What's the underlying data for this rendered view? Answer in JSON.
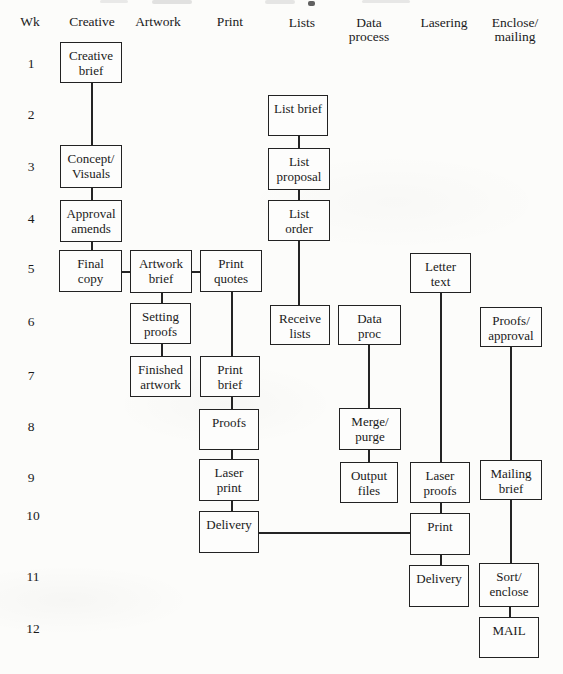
{
  "figure": {
    "type": "flowchart-schedule",
    "ink_color": "#222222",
    "paper_color": "#fcfcfa",
    "columns": [
      {
        "id": "wk",
        "lines": [
          "Wk"
        ],
        "x": 30,
        "y": 15
      },
      {
        "id": "creative",
        "lines": [
          "Creative"
        ],
        "x": 92,
        "y": 15
      },
      {
        "id": "artwork",
        "lines": [
          "Artwork"
        ],
        "x": 158,
        "y": 15
      },
      {
        "id": "print",
        "lines": [
          "Print"
        ],
        "x": 230,
        "y": 15
      },
      {
        "id": "lists",
        "lines": [
          "Lists"
        ],
        "x": 302,
        "y": 16
      },
      {
        "id": "data-process",
        "lines": [
          "Data",
          "process"
        ],
        "x": 369,
        "y": 16
      },
      {
        "id": "lasering",
        "lines": [
          "Lasering"
        ],
        "x": 444,
        "y": 16
      },
      {
        "id": "enclose-mailing",
        "lines": [
          "Enclose/",
          "mailing"
        ],
        "x": 515,
        "y": 16
      }
    ],
    "weeks": [
      {
        "label": "1",
        "x": 31,
        "y": 64
      },
      {
        "label": "2",
        "x": 31,
        "y": 115
      },
      {
        "label": "3",
        "x": 31,
        "y": 167
      },
      {
        "label": "4",
        "x": 31,
        "y": 219
      },
      {
        "label": "5",
        "x": 31,
        "y": 269
      },
      {
        "label": "6",
        "x": 31,
        "y": 322
      },
      {
        "label": "7",
        "x": 31,
        "y": 376
      },
      {
        "label": "8",
        "x": 31,
        "y": 427
      },
      {
        "label": "9",
        "x": 31,
        "y": 478
      },
      {
        "label": "10",
        "x": 33,
        "y": 516
      },
      {
        "label": "11",
        "x": 33,
        "y": 577
      },
      {
        "label": "12",
        "x": 33,
        "y": 629
      }
    ],
    "boxes": [
      {
        "id": "creative-brief",
        "column": "creative",
        "week": 1,
        "lines": [
          "Creative",
          "brief"
        ],
        "x": 60,
        "y": 42,
        "w": 62,
        "h": 41
      },
      {
        "id": "concept-visuals",
        "column": "creative",
        "week": 3,
        "lines": [
          "Concept/",
          "Visuals"
        ],
        "x": 60,
        "y": 145,
        "w": 62,
        "h": 43
      },
      {
        "id": "approval-amends",
        "column": "creative",
        "week": 4,
        "lines": [
          "Approval",
          "amends"
        ],
        "x": 60,
        "y": 200,
        "w": 62,
        "h": 42
      },
      {
        "id": "final-copy",
        "column": "creative",
        "week": 5,
        "lines": [
          "Final",
          "copy"
        ],
        "x": 59,
        "y": 250,
        "w": 63,
        "h": 42
      },
      {
        "id": "artwork-brief",
        "column": "artwork",
        "week": 5,
        "lines": [
          "Artwork",
          "brief"
        ],
        "x": 130,
        "y": 250,
        "w": 62,
        "h": 43
      },
      {
        "id": "setting-proofs",
        "column": "artwork",
        "week": 6,
        "lines": [
          "Setting",
          "proofs"
        ],
        "x": 130,
        "y": 303,
        "w": 61,
        "h": 41
      },
      {
        "id": "finished-artwork",
        "column": "artwork",
        "week": 7,
        "lines": [
          "Finished",
          "artwork"
        ],
        "x": 130,
        "y": 356,
        "w": 61,
        "h": 41
      },
      {
        "id": "print-quotes",
        "column": "print",
        "week": 5,
        "lines": [
          "Print",
          "quotes"
        ],
        "x": 200,
        "y": 250,
        "w": 62,
        "h": 42
      },
      {
        "id": "print-brief",
        "column": "print",
        "week": 7,
        "lines": [
          "Print",
          "brief"
        ],
        "x": 200,
        "y": 356,
        "w": 60,
        "h": 41
      },
      {
        "id": "proofs",
        "column": "print",
        "week": 8,
        "lines": [
          "Proofs"
        ],
        "x": 199,
        "y": 409,
        "w": 60,
        "h": 41
      },
      {
        "id": "laser-print",
        "column": "print",
        "week": 9,
        "lines": [
          "Laser",
          "print"
        ],
        "x": 199,
        "y": 459,
        "w": 60,
        "h": 42
      },
      {
        "id": "delivery-print",
        "column": "print",
        "week": 10,
        "lines": [
          "Delivery"
        ],
        "x": 199,
        "y": 511,
        "w": 60,
        "h": 42
      },
      {
        "id": "list-brief",
        "column": "lists",
        "week": 2,
        "lines": [
          "List brief"
        ],
        "x": 268,
        "y": 95,
        "w": 60,
        "h": 41
      },
      {
        "id": "list-proposal",
        "column": "lists",
        "week": 3,
        "lines": [
          "List",
          "proposal"
        ],
        "x": 268,
        "y": 148,
        "w": 62,
        "h": 42
      },
      {
        "id": "list-order",
        "column": "lists",
        "week": 4,
        "lines": [
          "List",
          "order"
        ],
        "x": 268,
        "y": 200,
        "w": 62,
        "h": 41
      },
      {
        "id": "receive-lists",
        "column": "lists",
        "week": 6,
        "lines": [
          "Receive",
          "lists"
        ],
        "x": 270,
        "y": 305,
        "w": 60,
        "h": 40
      },
      {
        "id": "data-proc",
        "column": "data-process",
        "week": 6,
        "lines": [
          "Data",
          "proc"
        ],
        "x": 338,
        "y": 305,
        "w": 63,
        "h": 40
      },
      {
        "id": "merge-purge",
        "column": "data-process",
        "week": 8,
        "lines": [
          "Merge/",
          "purge"
        ],
        "x": 339,
        "y": 408,
        "w": 62,
        "h": 42
      },
      {
        "id": "output-files",
        "column": "data-process",
        "week": 9,
        "lines": [
          "Output",
          "files"
        ],
        "x": 340,
        "y": 462,
        "w": 58,
        "h": 41
      },
      {
        "id": "letter-text",
        "column": "lasering",
        "week": 5,
        "lines": [
          "Letter",
          "text"
        ],
        "x": 410,
        "y": 253,
        "w": 61,
        "h": 40
      },
      {
        "id": "laser-proofs",
        "column": "lasering",
        "week": 9,
        "lines": [
          "Laser",
          "proofs"
        ],
        "x": 410,
        "y": 462,
        "w": 60,
        "h": 41
      },
      {
        "id": "print-lasering",
        "column": "lasering",
        "week": 10,
        "lines": [
          "Print"
        ],
        "x": 410,
        "y": 513,
        "w": 60,
        "h": 42
      },
      {
        "id": "delivery-lasering",
        "column": "lasering",
        "week": 11,
        "lines": [
          "Delivery"
        ],
        "x": 409,
        "y": 565,
        "w": 60,
        "h": 42
      },
      {
        "id": "proofs-approval",
        "column": "enclose-mailing",
        "week": 6,
        "lines": [
          "Proofs/",
          "approval"
        ],
        "x": 480,
        "y": 307,
        "w": 62,
        "h": 40
      },
      {
        "id": "mailing-brief",
        "column": "enclose-mailing",
        "week": 9,
        "lines": [
          "Mailing",
          "brief"
        ],
        "x": 480,
        "y": 460,
        "w": 62,
        "h": 40
      },
      {
        "id": "sort-enclose",
        "column": "enclose-mailing",
        "week": 11,
        "lines": [
          "Sort/",
          "enclose"
        ],
        "x": 479,
        "y": 563,
        "w": 60,
        "h": 44
      },
      {
        "id": "mail",
        "column": "enclose-mailing",
        "week": 12,
        "lines": [
          "MAIL"
        ],
        "x": 479,
        "y": 617,
        "w": 60,
        "h": 41
      }
    ],
    "connectors": [
      {
        "id": "creative-brief-to-concept-visuals",
        "orient": "v",
        "x": 91,
        "y1": 83,
        "y2": 145
      },
      {
        "id": "concept-visuals-to-approval-amends",
        "orient": "v",
        "x": 91,
        "y1": 188,
        "y2": 200
      },
      {
        "id": "approval-amends-to-final-copy",
        "orient": "v",
        "x": 91,
        "y1": 242,
        "y2": 250
      },
      {
        "id": "final-copy-to-artwork-brief",
        "orient": "h",
        "y": 271,
        "x1": 122,
        "x2": 130
      },
      {
        "id": "artwork-brief-to-print-quotes",
        "orient": "h",
        "y": 271,
        "x1": 192,
        "x2": 200
      },
      {
        "id": "artwork-brief-to-setting-proofs",
        "orient": "v",
        "x": 161,
        "y1": 293,
        "y2": 303
      },
      {
        "id": "setting-proofs-to-finished-artwork",
        "orient": "v",
        "x": 161,
        "y1": 344,
        "y2": 356
      },
      {
        "id": "print-quotes-to-print-brief",
        "orient": "v",
        "x": 231,
        "y1": 292,
        "y2": 356
      },
      {
        "id": "print-brief-to-proofs",
        "orient": "v",
        "x": 231,
        "y1": 397,
        "y2": 409
      },
      {
        "id": "proofs-to-laser-print",
        "orient": "v",
        "x": 231,
        "y1": 450,
        "y2": 459
      },
      {
        "id": "laser-print-to-delivery",
        "orient": "v",
        "x": 231,
        "y1": 501,
        "y2": 511
      },
      {
        "id": "delivery-to-print-lasering",
        "orient": "h",
        "y": 532,
        "x1": 259,
        "x2": 410
      },
      {
        "id": "list-brief-to-list-proposal",
        "orient": "v",
        "x": 298,
        "y1": 136,
        "y2": 148
      },
      {
        "id": "list-proposal-to-list-order",
        "orient": "v",
        "x": 298,
        "y1": 190,
        "y2": 200
      },
      {
        "id": "list-order-to-receive-lists",
        "orient": "v",
        "x": 298,
        "y1": 241,
        "y2": 305
      },
      {
        "id": "data-proc-to-merge-purge",
        "orient": "v",
        "x": 368,
        "y1": 345,
        "y2": 408
      },
      {
        "id": "merge-purge-to-output-files",
        "orient": "v",
        "x": 368,
        "y1": 450,
        "y2": 462
      },
      {
        "id": "letter-text-to-laser-proofs",
        "orient": "v",
        "x": 440,
        "y1": 293,
        "y2": 462
      },
      {
        "id": "laser-proofs-to-print-lasering",
        "orient": "v",
        "x": 440,
        "y1": 503,
        "y2": 513
      },
      {
        "id": "print-lasering-to-delivery-lasering",
        "orient": "v",
        "x": 440,
        "y1": 555,
        "y2": 565
      },
      {
        "id": "proofs-approval-to-mailing-brief",
        "orient": "v",
        "x": 510,
        "y1": 347,
        "y2": 460
      },
      {
        "id": "mailing-brief-to-sort-enclose",
        "orient": "v",
        "x": 510,
        "y1": 500,
        "y2": 563
      },
      {
        "id": "sort-enclose-to-mail",
        "orient": "v",
        "x": 509,
        "y1": 607,
        "y2": 617
      }
    ]
  }
}
